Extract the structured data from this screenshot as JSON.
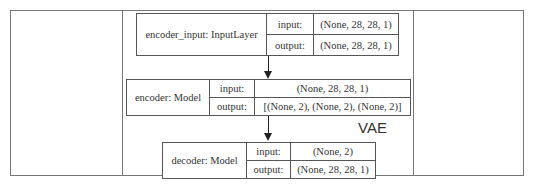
{
  "diagram": {
    "title_label": "VAE",
    "nodes": [
      {
        "name": "encoder_input: InputLayer",
        "input_key": "input:",
        "output_key": "output:",
        "input": "(None, 28, 28, 1)",
        "output": "(None, 28, 28, 1)"
      },
      {
        "name": "encoder: Model",
        "input_key": "input:",
        "output_key": "output:",
        "input": "(None, 28, 28, 1)",
        "output": "[(None, 2), (None, 2), (None, 2)]"
      },
      {
        "name": "decoder: Model",
        "input_key": "input:",
        "output_key": "output:",
        "input": "(None, 2)",
        "output": "(None, 28, 28, 1)"
      }
    ],
    "edges": [
      {
        "from": "encoder_input: InputLayer",
        "to": "encoder: Model"
      },
      {
        "from": "encoder: Model",
        "to": "decoder: Model"
      }
    ]
  }
}
